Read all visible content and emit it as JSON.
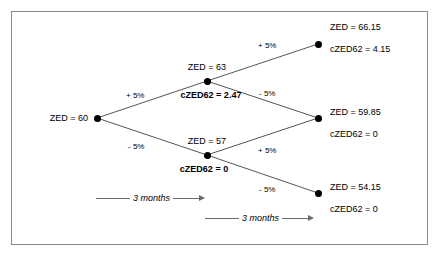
{
  "diagram": {
    "frame_color": "#8a8a8a",
    "node_color": "#000000",
    "branch_color": "#555555",
    "nodes": [
      {
        "id": "root",
        "price_label": "ZED = 60",
        "option_label": ""
      },
      {
        "id": "up",
        "price_label": "ZED = 63",
        "option_label": "cZED62 = 2.47"
      },
      {
        "id": "down",
        "price_label": "ZED = 57",
        "option_label": "cZED62 = 0"
      },
      {
        "id": "up-up",
        "price_label": "ZED = 66.15",
        "option_label": "cZED62 = 4.15"
      },
      {
        "id": "up-down",
        "price_label": "ZED = 59.85",
        "option_label": "cZED62 = 0"
      },
      {
        "id": "down-down",
        "price_label": "ZED = 54.15",
        "option_label": "cZED62 = 0"
      }
    ],
    "branches": [
      {
        "id": "root-up",
        "label": "+ 5%"
      },
      {
        "id": "root-down",
        "label": "- 5%"
      },
      {
        "id": "up-up",
        "label": "+ 5%"
      },
      {
        "id": "up-down",
        "label": "- 5%"
      },
      {
        "id": "down-up",
        "label": "+ 5%"
      },
      {
        "id": "down-down",
        "label": "- 5%"
      }
    ],
    "timeline": [
      {
        "id": "period-1",
        "label": "3 months"
      },
      {
        "id": "period-2",
        "label": "3 months"
      }
    ]
  }
}
